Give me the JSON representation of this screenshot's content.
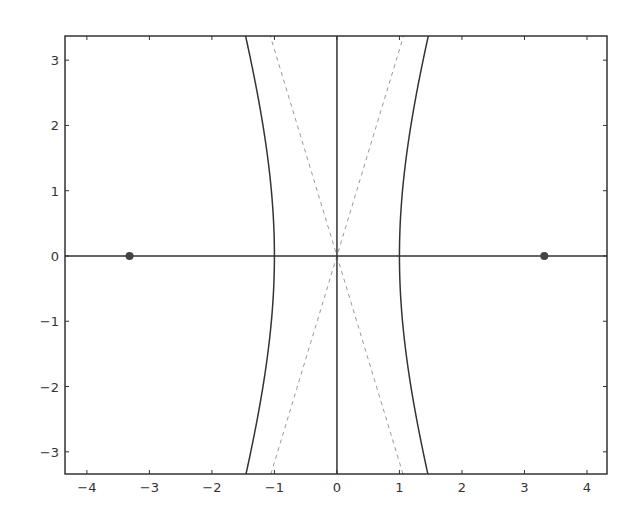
{
  "chart_data": {
    "type": "line",
    "title": "",
    "xlabel": "",
    "ylabel": "",
    "xlim": [
      -4.35,
      4.32
    ],
    "ylim": [
      -3.34,
      3.37
    ],
    "grid": false,
    "legend": null,
    "xticks": [
      -4,
      -3,
      -2,
      -1,
      0,
      1,
      2,
      3,
      4
    ],
    "yticks": [
      -3,
      -2,
      -1,
      0,
      1,
      2,
      3
    ],
    "xtick_labels": [
      "−4",
      "−3",
      "−2",
      "−1",
      "0",
      "1",
      "2",
      "3",
      "4"
    ],
    "ytick_labels": [
      "−3",
      "−2",
      "−1",
      "0",
      "1",
      "2",
      "3"
    ],
    "series": [
      {
        "name": "hyperbola",
        "style": "solid",
        "color": "#333333",
        "equation": "x^2/1 - y^2/10 = 1",
        "a": 1,
        "b": 3.162
      },
      {
        "name": "asymptote-positive",
        "style": "dashed",
        "color": "#999999",
        "equation": "y = 3.162x"
      },
      {
        "name": "asymptote-negative",
        "style": "dashed",
        "color": "#999999",
        "equation": "y = -3.162x"
      },
      {
        "name": "x-axis",
        "style": "solid",
        "color": "#333333",
        "equation": "y = 0"
      },
      {
        "name": "y-axis",
        "style": "solid",
        "color": "#333333",
        "equation": "x = 0"
      }
    ],
    "points": [
      {
        "name": "focus-left",
        "x": -3.317,
        "y": 0
      },
      {
        "name": "focus-right",
        "x": 3.317,
        "y": 0
      }
    ]
  },
  "layout": {
    "plot_left": 65,
    "plot_right": 607,
    "plot_top": 36,
    "plot_bottom": 474
  }
}
